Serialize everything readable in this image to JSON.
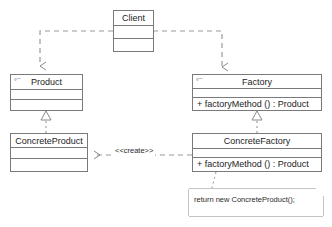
{
  "diagram": {
    "type": "uml-class-diagram",
    "line_color": "#7a7a7a",
    "text_color": "#1c1c1c",
    "background": "#ffffff"
  },
  "classes": {
    "client": {
      "name": "Client",
      "abstract": false,
      "abstract_marker": "",
      "attributes": [],
      "operations": []
    },
    "product": {
      "name": "Product",
      "abstract": true,
      "abstract_marker": "°¯",
      "attributes": [],
      "operations": []
    },
    "factory": {
      "name": "Factory",
      "abstract": true,
      "abstract_marker": "°¯",
      "attributes": [],
      "operations": [
        "+ factoryMethod () : Product"
      ]
    },
    "concrete_product": {
      "name": "ConcreteProduct",
      "abstract": false,
      "abstract_marker": "",
      "attributes": [],
      "operations": []
    },
    "concrete_factory": {
      "name": "ConcreteFactory",
      "abstract": false,
      "abstract_marker": "",
      "attributes": [],
      "operations": [
        "+ factoryMethod () : Product"
      ]
    }
  },
  "note": {
    "text": "return new ConcreteProduct();"
  },
  "relationships": {
    "client_to_product": {
      "kind": "dependency",
      "label": ""
    },
    "client_to_factory": {
      "kind": "dependency",
      "label": ""
    },
    "concrete_product_to_product": {
      "kind": "realization",
      "label": ""
    },
    "concrete_factory_to_factory": {
      "kind": "realization",
      "label": ""
    },
    "concrete_factory_creates_product": {
      "kind": "dependency",
      "label": "<<create>>"
    },
    "note_anchor": {
      "kind": "note-link",
      "label": ""
    }
  }
}
